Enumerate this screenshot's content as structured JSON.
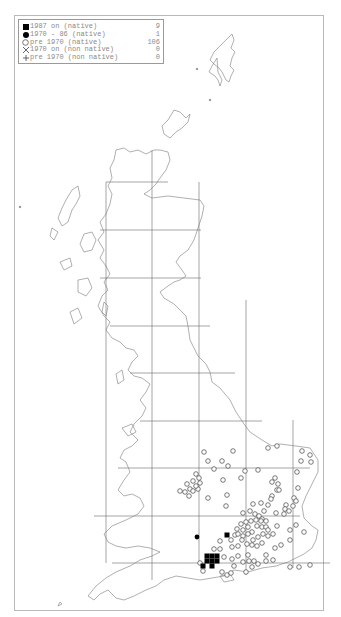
{
  "legend": {
    "items": [
      {
        "symbol": "filled-square",
        "label": "1987 on (native)",
        "count": "9"
      },
      {
        "symbol": "filled-circle",
        "label": "1970 - 86 (native)",
        "count": "1"
      },
      {
        "symbol": "open-circle",
        "label": "pre 1970 (native)",
        "count": "106"
      },
      {
        "symbol": "cross",
        "label": "1970 on (non native)",
        "count": "0"
      },
      {
        "symbol": "plus",
        "label": "pre 1970 (non native)",
        "count": "0"
      }
    ]
  },
  "colors": {
    "frame": "#b9b9b9",
    "coast": "#7a7a7a",
    "grid": "#6a6a6a",
    "marker": "#000000",
    "legend_text": "#8a8a8a"
  },
  "grid": {
    "vertical_x": [
      106,
      152,
      199,
      246,
      293
    ],
    "horizontal_y": [
      182,
      230,
      278,
      326,
      373,
      421,
      468,
      516,
      563
    ]
  },
  "records": {
    "squares_1987_on": [
      [
        207,
        556
      ],
      [
        212,
        556
      ],
      [
        217,
        556
      ],
      [
        207,
        561
      ],
      [
        212,
        561
      ],
      [
        217,
        561
      ],
      [
        212,
        566
      ],
      [
        203,
        566
      ],
      [
        227,
        535
      ]
    ],
    "circles_1970_86": [
      [
        197,
        537
      ]
    ],
    "open_pre_1970": [
      [
        204,
        452
      ],
      [
        233,
        451
      ],
      [
        268,
        448
      ],
      [
        277,
        446
      ],
      [
        302,
        451
      ],
      [
        310,
        455
      ],
      [
        311,
        462
      ],
      [
        301,
        461
      ],
      [
        208,
        461
      ],
      [
        222,
        461
      ],
      [
        214,
        469
      ],
      [
        228,
        466
      ],
      [
        245,
        471
      ],
      [
        258,
        470
      ],
      [
        297,
        472
      ],
      [
        277,
        490
      ],
      [
        275,
        478
      ],
      [
        272,
        482
      ],
      [
        278,
        484
      ],
      [
        279,
        490
      ],
      [
        272,
        496
      ],
      [
        241,
        478
      ],
      [
        223,
        480
      ],
      [
        196,
        474
      ],
      [
        199,
        478
      ],
      [
        193,
        481
      ],
      [
        200,
        483
      ],
      [
        190,
        489
      ],
      [
        193,
        491
      ],
      [
        198,
        489
      ],
      [
        196,
        486
      ],
      [
        185,
        492
      ],
      [
        189,
        496
      ],
      [
        187,
        484
      ],
      [
        180,
        491
      ],
      [
        227,
        495
      ],
      [
        208,
        498
      ],
      [
        226,
        506
      ],
      [
        253,
        504
      ],
      [
        261,
        503
      ],
      [
        271,
        499
      ],
      [
        268,
        505
      ],
      [
        298,
        488
      ],
      [
        294,
        498
      ],
      [
        296,
        501
      ],
      [
        293,
        506
      ],
      [
        286,
        505
      ],
      [
        285,
        509
      ],
      [
        289,
        511
      ],
      [
        284,
        514
      ],
      [
        276,
        513
      ],
      [
        264,
        511
      ],
      [
        243,
        513
      ],
      [
        250,
        511
      ],
      [
        255,
        514
      ],
      [
        259,
        516
      ],
      [
        262,
        519
      ],
      [
        246,
        522
      ],
      [
        251,
        521
      ],
      [
        256,
        520
      ],
      [
        261,
        521
      ],
      [
        266,
        521
      ],
      [
        241,
        524
      ],
      [
        243,
        530
      ],
      [
        248,
        527
      ],
      [
        252,
        532
      ],
      [
        257,
        526
      ],
      [
        262,
        527
      ],
      [
        266,
        527
      ],
      [
        237,
        529
      ],
      [
        235,
        535
      ],
      [
        231,
        540
      ],
      [
        238,
        534
      ],
      [
        243,
        536
      ],
      [
        248,
        534
      ],
      [
        253,
        540
      ],
      [
        258,
        537
      ],
      [
        263,
        534
      ],
      [
        268,
        530
      ],
      [
        242,
        540
      ],
      [
        247,
        544
      ],
      [
        252,
        545
      ],
      [
        257,
        546
      ],
      [
        262,
        543
      ],
      [
        238,
        546
      ],
      [
        232,
        547
      ],
      [
        268,
        536
      ],
      [
        273,
        534
      ],
      [
        220,
        541
      ],
      [
        214,
        549
      ],
      [
        220,
        549
      ],
      [
        224,
        557
      ],
      [
        232,
        559
      ],
      [
        238,
        556
      ],
      [
        243,
        562
      ],
      [
        249,
        561
      ],
      [
        254,
        561
      ],
      [
        258,
        564
      ],
      [
        273,
        560
      ],
      [
        275,
        548
      ],
      [
        281,
        545
      ],
      [
        290,
        540
      ],
      [
        304,
        532
      ],
      [
        296,
        525
      ],
      [
        277,
        526
      ],
      [
        290,
        530
      ],
      [
        266,
        555
      ],
      [
        266,
        561
      ],
      [
        200,
        563
      ],
      [
        203,
        571
      ],
      [
        222,
        572
      ],
      [
        227,
        575
      ],
      [
        231,
        573
      ],
      [
        234,
        566
      ],
      [
        246,
        572
      ],
      [
        252,
        567
      ],
      [
        248,
        555
      ],
      [
        299,
        567
      ],
      [
        310,
        565
      ],
      [
        290,
        567
      ]
    ]
  }
}
